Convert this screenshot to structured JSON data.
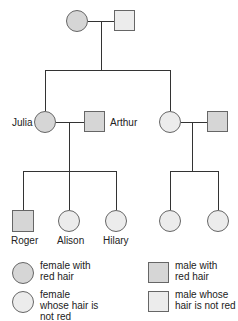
{
  "diagram": {
    "type": "pedigree",
    "colors": {
      "red_hair_fill": "#d6d6d6",
      "not_red_hair_fill": "#ececec",
      "line": "#333333"
    },
    "generation1": {
      "female": {
        "label": "",
        "trait": "red hair"
      },
      "male": {
        "label": "",
        "trait": "not red"
      }
    },
    "generation2": {
      "left_couple": {
        "female": {
          "label": "Julia",
          "trait": "red hair"
        },
        "male": {
          "label": "Arthur",
          "trait": "red hair"
        }
      },
      "right_couple": {
        "female": {
          "label": "",
          "trait": "not red"
        },
        "male": {
          "label": "",
          "trait": "red hair"
        }
      }
    },
    "generation3": {
      "left_children": [
        {
          "label": "Roger",
          "sex": "male",
          "trait": "red hair"
        },
        {
          "label": "Alison",
          "sex": "female",
          "trait": "not red"
        },
        {
          "label": "Hilary",
          "sex": "female",
          "trait": "not red"
        }
      ],
      "right_children": [
        {
          "label": "",
          "sex": "female",
          "trait": "not red"
        },
        {
          "label": "",
          "sex": "female",
          "trait": "not red"
        }
      ]
    }
  },
  "legend": {
    "female_red": "female with red hair",
    "female_not_red": "female whose hair is not red",
    "male_red": "male with red hair",
    "male_not_red": "male whose hair is not red"
  }
}
